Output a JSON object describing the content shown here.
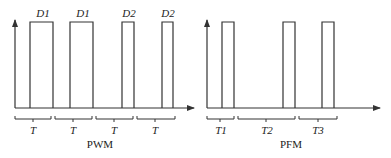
{
  "pwm": {
    "caption": "PWM",
    "pulse_labels": [
      "D1",
      "D1",
      "D2",
      "D2"
    ],
    "period_labels": [
      "T",
      "T",
      "T",
      "T"
    ]
  },
  "pfm": {
    "caption": "PFM",
    "period_labels": [
      "T1",
      "T2",
      "T3"
    ]
  },
  "colors": {
    "stroke": "#333333",
    "background": "#ffffff"
  }
}
